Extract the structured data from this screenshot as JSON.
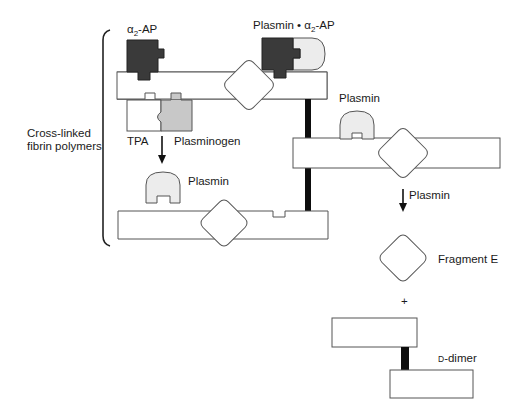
{
  "diagram": {
    "group_label_line1": "Cross-linked",
    "group_label_line2": "fibrin polymers",
    "labels": {
      "alpha2_ap_prefix": "α",
      "alpha2_ap_sub": "2",
      "alpha2_ap_suffix": "-AP",
      "plasmin_complex_prefix": "Plasmin • α",
      "plasmin_complex_sub": "2",
      "plasmin_complex_suffix": "-AP",
      "tpa": "TPA",
      "plasminogen": "Plasminogen",
      "plasmin_left": "Plasmin",
      "plasmin_right": "Plasmin",
      "plasmin_arrow": "Plasmin",
      "fragment_e": "Fragment E",
      "plus": "+",
      "d_dimer_prefix": "D",
      "d_dimer_suffix": "-dimer"
    },
    "colors": {
      "alpha2_ap_fill": "#3a3a3a",
      "plasmin_fill": "#ececec",
      "plasminogen_fill": "#c8c8c8",
      "crosslink_fill": "#0d0d0d",
      "outline": "#555555",
      "background": "#ffffff"
    }
  }
}
